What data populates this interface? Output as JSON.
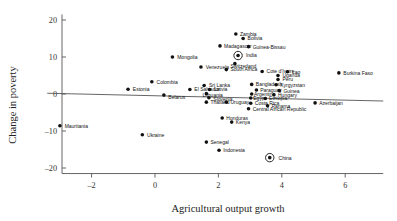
{
  "chart_data": {
    "type": "scatter",
    "title": "",
    "xlabel": "Agricultural output growth",
    "ylabel": "Change in poverty",
    "xlim": [
      -3.4,
      7.2
    ],
    "ylim": [
      -21.5,
      21.5
    ],
    "xticks": [
      -2,
      0,
      2,
      4,
      6
    ],
    "xticklabels": [
      "–2",
      "0",
      "2",
      "4",
      "6"
    ],
    "yticks": [
      20,
      10,
      0,
      -10,
      -20
    ],
    "yticklabels": [
      "20",
      "10",
      "0",
      "–10",
      "–20"
    ],
    "grid": false,
    "legend": null,
    "trendline": {
      "label": "fitted regression line",
      "x_start": -3.4,
      "y_start": 0.2,
      "x_end": 7.2,
      "y_end": -1.9
    },
    "highlighted_points": [
      "India",
      "China"
    ],
    "points": [
      {
        "label": "Mauritania",
        "x": -3.0,
        "y": -8.6,
        "lx": -2.85,
        "ly": -8.6,
        "anchor": "start"
      },
      {
        "label": "Estonia",
        "x": -0.85,
        "y": 1.3,
        "lx": -0.7,
        "ly": 1.3,
        "anchor": "start"
      },
      {
        "label": "Ukraine",
        "x": -0.4,
        "y": -11.0,
        "lx": -0.25,
        "ly": -11.0,
        "anchor": "start"
      },
      {
        "label": "Colombia",
        "x": -0.1,
        "y": 3.3,
        "lx": 0.05,
        "ly": 3.3,
        "anchor": "start"
      },
      {
        "label": "Mongolia",
        "x": 0.55,
        "y": 10.0,
        "lx": 0.7,
        "ly": 10.0,
        "anchor": "start"
      },
      {
        "label": "Belarus",
        "x": 0.28,
        "y": -0.3,
        "lx": 0.42,
        "ly": -0.9,
        "anchor": "start"
      },
      {
        "label": "El Salvador",
        "x": 1.1,
        "y": 1.2,
        "lx": 1.24,
        "ly": 1.2,
        "anchor": "start"
      },
      {
        "label": "Venezuela",
        "x": 1.45,
        "y": 7.3,
        "lx": 1.6,
        "ly": 7.3,
        "anchor": "start"
      },
      {
        "label": "Sri Lanka",
        "x": 1.55,
        "y": 2.3,
        "lx": 1.7,
        "ly": 2.3,
        "anchor": "start"
      },
      {
        "label": "Latvia",
        "x": 1.72,
        "y": 1.2,
        "lx": 1.86,
        "ly": 1.2,
        "anchor": "start"
      },
      {
        "label": "Lithuania",
        "x": 1.62,
        "y": 0.1,
        "lx": 1.5,
        "ly": -0.4,
        "anchor": "start"
      },
      {
        "label": "Slovenia",
        "x": 1.7,
        "y": -1.0,
        "lx": 1.84,
        "ly": -1.4,
        "anchor": "start"
      },
      {
        "label": "Madagascar",
        "x": 2.05,
        "y": 13.0,
        "lx": 2.18,
        "ly": 13.0,
        "anchor": "start"
      },
      {
        "label": "Zambia",
        "x": 2.55,
        "y": 16.2,
        "lx": 2.68,
        "ly": 16.2,
        "anchor": "start"
      },
      {
        "label": "Bolivia",
        "x": 2.78,
        "y": 15.0,
        "lx": 2.92,
        "ly": 15.0,
        "anchor": "start"
      },
      {
        "label": "Guinea-Bissau",
        "x": 2.95,
        "y": 12.8,
        "lx": 3.08,
        "ly": 12.8,
        "anchor": "start"
      },
      {
        "label": "India",
        "x": 2.62,
        "y": 10.4,
        "lx": 2.82,
        "ly": 10.4,
        "anchor": "start",
        "highlight": true
      },
      {
        "label": "Switzerland",
        "x": 2.52,
        "y": 8.2,
        "lx": 2.38,
        "ly": 7.6,
        "anchor": "start"
      },
      {
        "label": "South Africa",
        "x": 2.25,
        "y": 6.6,
        "lx": 2.38,
        "ly": 6.6,
        "anchor": "start"
      },
      {
        "label": "Cote d'Ivoire",
        "x": 3.38,
        "y": 6.1,
        "lx": 3.52,
        "ly": 6.1,
        "anchor": "start"
      },
      {
        "label": "Lao",
        "x": 4.18,
        "y": 6.0,
        "lx": 4.32,
        "ly": 6.0,
        "anchor": "start"
      },
      {
        "label": "Uganda",
        "x": 3.88,
        "y": 5.0,
        "lx": 4.02,
        "ly": 5.0,
        "anchor": "start"
      },
      {
        "label": "Peru",
        "x": 3.88,
        "y": 3.9,
        "lx": 4.02,
        "ly": 3.9,
        "anchor": "start"
      },
      {
        "label": "Burkina Faso",
        "x": 5.8,
        "y": 5.7,
        "lx": 5.94,
        "ly": 5.7,
        "anchor": "start"
      },
      {
        "label": "Bangladesh",
        "x": 3.05,
        "y": 2.6,
        "lx": 3.18,
        "ly": 2.6,
        "anchor": "start"
      },
      {
        "label": "Kyrgyzstan",
        "x": 3.82,
        "y": 2.5,
        "lx": 3.95,
        "ly": 2.5,
        "anchor": "start"
      },
      {
        "label": "Paraguay",
        "x": 3.2,
        "y": 1.1,
        "lx": 3.32,
        "ly": 1.1,
        "anchor": "start"
      },
      {
        "label": "Guinea",
        "x": 3.92,
        "y": 0.9,
        "lx": 4.05,
        "ly": 0.9,
        "anchor": "start"
      },
      {
        "label": "Argentina",
        "x": 3.05,
        "y": 0.0,
        "lx": 3.12,
        "ly": 0.0,
        "anchor": "start"
      },
      {
        "label": "Hungary",
        "x": 3.75,
        "y": -0.2,
        "lx": 3.88,
        "ly": -0.2,
        "anchor": "start"
      },
      {
        "label": "Egypt",
        "x": 3.02,
        "y": -1.1,
        "lx": 3.1,
        "ly": -1.1,
        "anchor": "start"
      },
      {
        "label": "Ethiopia",
        "x": 3.48,
        "y": -1.2,
        "lx": 3.6,
        "ly": -1.2,
        "anchor": "start"
      },
      {
        "label": "Costa Rica",
        "x": 3.02,
        "y": -2.5,
        "lx": 3.15,
        "ly": -2.5,
        "anchor": "start"
      },
      {
        "label": "Panama",
        "x": 3.55,
        "y": -3.2,
        "lx": 3.68,
        "ly": -3.2,
        "anchor": "start"
      },
      {
        "label": "Thailand",
        "x": 1.62,
        "y": -2.2,
        "lx": 1.75,
        "ly": -2.2,
        "anchor": "start"
      },
      {
        "label": "Uruguay",
        "x": 2.25,
        "y": -2.2,
        "lx": 2.38,
        "ly": -2.2,
        "anchor": "start"
      },
      {
        "label": "Central African Republic",
        "x": 2.95,
        "y": -4.0,
        "lx": 3.08,
        "ly": -4.0,
        "anchor": "start"
      },
      {
        "label": "Azerbaijan",
        "x": 5.05,
        "y": -2.4,
        "lx": 5.18,
        "ly": -2.4,
        "anchor": "start"
      },
      {
        "label": "Honduras",
        "x": 2.12,
        "y": -6.5,
        "lx": 2.25,
        "ly": -6.5,
        "anchor": "start"
      },
      {
        "label": "Kenya",
        "x": 2.42,
        "y": -7.6,
        "lx": 2.55,
        "ly": -7.6,
        "anchor": "start"
      },
      {
        "label": "Senegal",
        "x": 1.62,
        "y": -13.0,
        "lx": 1.75,
        "ly": -13.0,
        "anchor": "start"
      },
      {
        "label": "Indonesia",
        "x": 2.02,
        "y": -15.2,
        "lx": 2.15,
        "ly": -15.2,
        "anchor": "start"
      },
      {
        "label": "China",
        "x": 3.62,
        "y": -17.2,
        "lx": 3.85,
        "ly": -17.2,
        "anchor": "start",
        "highlight": true
      }
    ]
  },
  "colors": {
    "axis": "#555555",
    "point": "#111111",
    "text": "#222222",
    "background": "#ffffff"
  }
}
